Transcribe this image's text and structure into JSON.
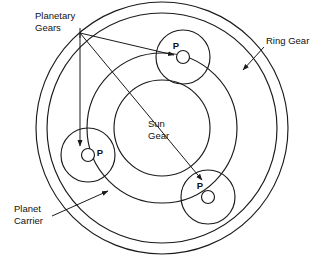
{
  "diagram": {
    "background_color": "#ffffff",
    "line_color": "#1a1a1a",
    "canvas": {
      "width": 325,
      "height": 274
    },
    "center": {
      "x": 162,
      "y": 128
    }
  },
  "labels": {
    "planetary_gears_line1": "Planetary",
    "planetary_gears_line2": "Gears",
    "ring_gear": "Ring Gear",
    "planet_carrier_line1": "Planet",
    "planet_carrier_line2": "Carrier",
    "sun_gear_line1": "Sun",
    "sun_gear_line2": "Gear",
    "planet_marker": "P"
  },
  "components": {
    "ring_gear": {
      "name": "Ring Gear",
      "outer_radius": 126,
      "inner_radius": 115
    },
    "planet_carrier": {
      "name": "Planet Carrier",
      "radius": 75
    },
    "sun_gear": {
      "name": "Sun Gear",
      "radius": 48
    },
    "planets": [
      {
        "id": "planet-top",
        "marker": "P",
        "cx": 183,
        "cy": 57,
        "radius": 27,
        "hub_radius": 6.5,
        "marker_dx": -7,
        "marker_dy": -7
      },
      {
        "id": "planet-left",
        "marker": "P",
        "cx": 88,
        "cy": 155,
        "radius": 27,
        "hub_radius": 6.5,
        "marker_dx": 9,
        "marker_dy": -2
      },
      {
        "id": "planet-bottom-right",
        "marker": "P",
        "cx": 208,
        "cy": 197,
        "radius": 27,
        "hub_radius": 6.5,
        "marker_dx": -8,
        "marker_dy": -8
      }
    ]
  },
  "annotations": [
    {
      "id": "ann-planetary-gears",
      "label": "Planetary Gears",
      "anchor": {
        "x": 80,
        "y": 33
      }
    },
    {
      "id": "ann-ring-gear",
      "label": "Ring Gear",
      "anchor": {
        "x": 263,
        "y": 44
      }
    },
    {
      "id": "ann-planet-carrier",
      "label": "Planet Carrier",
      "anchor": {
        "x": 52,
        "y": 214
      }
    }
  ]
}
